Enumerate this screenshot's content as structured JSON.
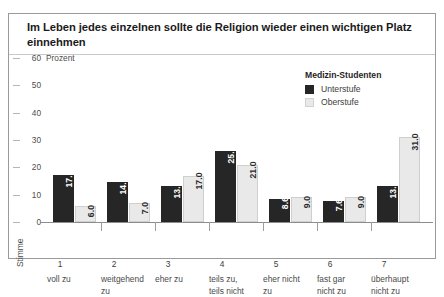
{
  "figure": {
    "title": "Im Leben jedes einzelnen sollte die Religion wieder einen wichtigen Platz einnehmen",
    "axis_label_y": "Prozent",
    "axis_label_x": "Stimme"
  },
  "legend": {
    "title": "Medizin-Studenten",
    "items": [
      {
        "label": "Unterstufe",
        "color": "#262626"
      },
      {
        "label": "Oberstufe",
        "color": "#e9e9e9"
      }
    ]
  },
  "chart_data": {
    "type": "bar",
    "title": "Im Leben jedes einzelnen sollte die Religion wieder einen wichtigen Platz einnehmen",
    "xlabel": "Stimme",
    "ylabel": "Prozent",
    "ylim": [
      0,
      60
    ],
    "yticks": [
      0,
      10,
      20,
      30,
      40,
      50,
      60
    ],
    "grid": false,
    "legend_position": "top-right",
    "legend_title": "Medizin-Studenten",
    "categories": [
      "1",
      "2",
      "3",
      "4",
      "5",
      "6",
      "7"
    ],
    "category_labels": [
      "voll zu",
      "weitgehend\nzu",
      "eher zu",
      "teils zu,\nteils nicht",
      "eher nicht\nzu",
      "fast gar\nnicht zu",
      "überhaupt\nnicht zu"
    ],
    "series": [
      {
        "name": "Unterstufe",
        "color": "#262626",
        "values": [
          17.3,
          14.6,
          13.0,
          25.9,
          8.6,
          7.6,
          13.0
        ],
        "labels": [
          "17.3",
          "14.6",
          "13.0",
          "25.9",
          "8.6",
          "7.6",
          "13.0"
        ]
      },
      {
        "name": "Oberstufe",
        "color": "#e9e9e9",
        "values": [
          6.0,
          7.0,
          17.0,
          21.0,
          9.0,
          9.0,
          31.0
        ],
        "labels": [
          "6.0",
          "7.0",
          "17.0",
          "21.0",
          "9.0",
          "9.0",
          "31.0"
        ]
      }
    ]
  }
}
